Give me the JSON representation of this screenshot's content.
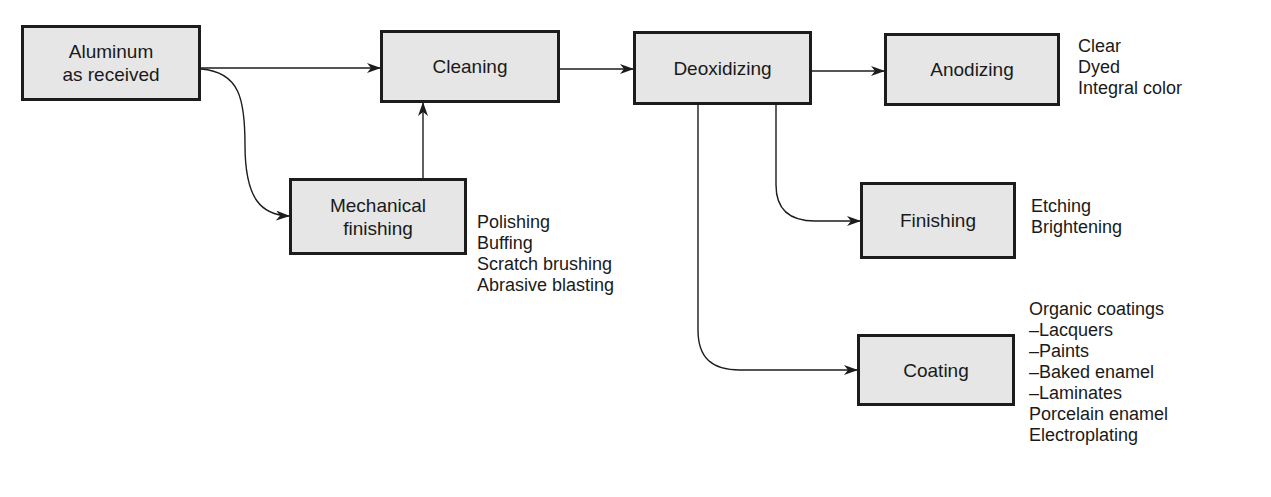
{
  "diagram": {
    "type": "process-flowchart",
    "nodes": {
      "aluminum": {
        "lines": [
          "Aluminum",
          "as received"
        ]
      },
      "cleaning": {
        "lines": [
          "Cleaning"
        ]
      },
      "deoxidizing": {
        "lines": [
          "Deoxidizing"
        ]
      },
      "anodizing": {
        "lines": [
          "Anodizing"
        ]
      },
      "mechanical": {
        "lines": [
          "Mechanical",
          "finishing"
        ]
      },
      "finishing": {
        "lines": [
          "Finishing"
        ]
      },
      "coating": {
        "lines": [
          "Coating"
        ]
      }
    },
    "notes": {
      "anodizing": [
        "Clear",
        "Dyed",
        "Integral color"
      ],
      "mechanical": [
        "Polishing",
        "Buffing",
        "Scratch brushing",
        "Abrasive blasting"
      ],
      "finishing": [
        "Etching",
        "Brightening"
      ],
      "coating": [
        "Organic coatings",
        "–Lacquers",
        "–Paints",
        "–Baked enamel",
        "–Laminates",
        "Porcelain enamel",
        "Electroplating"
      ]
    },
    "edges": [
      {
        "from": "aluminum",
        "to": "cleaning"
      },
      {
        "from": "aluminum",
        "to": "mechanical"
      },
      {
        "from": "mechanical",
        "to": "cleaning"
      },
      {
        "from": "cleaning",
        "to": "deoxidizing"
      },
      {
        "from": "deoxidizing",
        "to": "anodizing"
      },
      {
        "from": "deoxidizing",
        "to": "finishing"
      },
      {
        "from": "deoxidizing",
        "to": "coating"
      }
    ],
    "colors": {
      "box_fill": "#e6e6e6",
      "stroke": "#1c1c1c"
    }
  }
}
